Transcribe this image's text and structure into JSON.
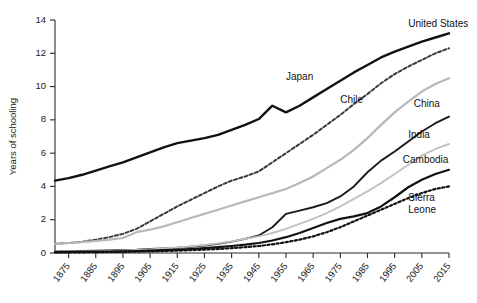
{
  "chart_data": {
    "type": "line",
    "title": "",
    "xlabel": "",
    "ylabel": "Years of schooling",
    "xlim": [
      1870,
      2015
    ],
    "ylim": [
      0,
      14
    ],
    "yticks": [
      0,
      2,
      4,
      6,
      8,
      10,
      12,
      14
    ],
    "xticks": [
      1875,
      1885,
      1895,
      1905,
      1915,
      1925,
      1935,
      1945,
      1955,
      1965,
      1975,
      1985,
      1995,
      2005,
      2015
    ],
    "grid": false,
    "legend_position": "inline-right-of-lines",
    "x": [
      1870,
      1875,
      1880,
      1885,
      1890,
      1895,
      1900,
      1905,
      1910,
      1915,
      1920,
      1925,
      1930,
      1935,
      1940,
      1945,
      1950,
      1955,
      1960,
      1965,
      1970,
      1975,
      1980,
      1985,
      1990,
      1995,
      2000,
      2005,
      2010,
      2015
    ],
    "series": [
      {
        "name": "United States",
        "style": "solid",
        "color": "#111111",
        "width": 2.4,
        "label_x": 2000,
        "label_y": 13.6,
        "values": [
          4.35,
          4.5,
          4.7,
          4.95,
          5.2,
          5.45,
          5.75,
          6.05,
          6.35,
          6.6,
          6.75,
          6.9,
          7.1,
          7.4,
          7.7,
          8.05,
          8.85,
          8.45,
          8.85,
          9.35,
          9.85,
          10.35,
          10.85,
          11.3,
          11.75,
          12.1,
          12.4,
          12.7,
          12.95,
          13.2
        ]
      },
      {
        "name": "Japan",
        "style": "dashed",
        "color": "#3a3a3a",
        "width": 2.0,
        "label_x": 1955,
        "label_y": 10.4,
        "values": [
          0.55,
          0.6,
          0.68,
          0.8,
          0.95,
          1.15,
          1.45,
          1.9,
          2.35,
          2.8,
          3.2,
          3.6,
          4.0,
          4.35,
          4.6,
          4.9,
          5.45,
          6.0,
          6.55,
          7.1,
          7.7,
          8.3,
          8.95,
          9.55,
          10.2,
          10.75,
          11.2,
          11.6,
          12.0,
          12.3
        ]
      },
      {
        "name": "Chile",
        "style": "solid",
        "color": "#b8b8b8",
        "width": 2.2,
        "label_x": 1975,
        "label_y": 9.0,
        "values": [
          0.55,
          0.6,
          0.65,
          0.72,
          0.8,
          0.9,
          1.25,
          1.4,
          1.6,
          1.85,
          2.1,
          2.35,
          2.6,
          2.85,
          3.1,
          3.35,
          3.6,
          3.85,
          4.2,
          4.6,
          5.1,
          5.6,
          6.2,
          6.9,
          7.7,
          8.45,
          9.1,
          9.7,
          10.15,
          10.5
        ]
      },
      {
        "name": "China",
        "style": "solid",
        "color": "#1a1a1a",
        "width": 1.9,
        "label_x": 2002,
        "label_y": 8.8,
        "values": [
          0.1,
          0.11,
          0.12,
          0.14,
          0.16,
          0.18,
          0.2,
          0.24,
          0.28,
          0.32,
          0.38,
          0.45,
          0.55,
          0.68,
          0.85,
          1.05,
          1.55,
          2.35,
          2.55,
          2.75,
          3.0,
          3.4,
          4.0,
          4.85,
          5.55,
          6.1,
          6.7,
          7.3,
          7.8,
          8.2
        ]
      },
      {
        "name": "India",
        "style": "solid",
        "color": "#c2c2c2",
        "width": 1.9,
        "label_x": 2000,
        "label_y": 6.9,
        "values": [
          0.08,
          0.09,
          0.1,
          0.11,
          0.13,
          0.15,
          0.18,
          0.22,
          0.27,
          0.33,
          0.4,
          0.48,
          0.58,
          0.7,
          0.85,
          1.0,
          1.2,
          1.45,
          1.75,
          2.05,
          2.4,
          2.8,
          3.25,
          3.7,
          4.2,
          4.75,
          5.3,
          5.85,
          6.25,
          6.55
        ]
      },
      {
        "name": "Cambodia",
        "style": "solid",
        "color": "#111111",
        "width": 2.2,
        "label_x": 1998,
        "label_y": 5.4,
        "values": [
          0.05,
          0.06,
          0.07,
          0.08,
          0.09,
          0.1,
          0.12,
          0.14,
          0.17,
          0.2,
          0.24,
          0.29,
          0.35,
          0.42,
          0.5,
          0.6,
          0.75,
          0.95,
          1.2,
          1.5,
          1.8,
          2.05,
          2.2,
          2.4,
          2.8,
          3.35,
          3.95,
          4.4,
          4.75,
          5.0
        ]
      },
      {
        "name": "Sierra Leone",
        "style": "dotted",
        "color": "#111111",
        "width": 2.2,
        "label_x": 2000,
        "label_y": 3.1,
        "values": [
          0.03,
          0.04,
          0.04,
          0.05,
          0.06,
          0.07,
          0.08,
          0.1,
          0.12,
          0.14,
          0.17,
          0.2,
          0.24,
          0.29,
          0.35,
          0.42,
          0.52,
          0.65,
          0.8,
          1.0,
          1.25,
          1.55,
          1.9,
          2.25,
          2.6,
          2.95,
          3.3,
          3.6,
          3.85,
          4.0
        ]
      }
    ]
  }
}
